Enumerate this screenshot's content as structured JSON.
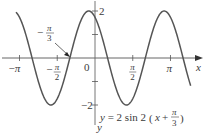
{
  "chart_data": {
    "type": "line",
    "title": "",
    "equation": "y = 2 sin 2(x + π/3)",
    "equation_parts": {
      "prefix": "y = 2 sin 2",
      "open": "(",
      "x": "x + ",
      "frac_num": "π",
      "frac_den": "3",
      "close": ")"
    },
    "xlabel": "x",
    "ylabel": "y",
    "xlim": [
      -3.29,
      4.4
    ],
    "ylim": [
      -2.1,
      2.3
    ],
    "x_ticks": [
      {
        "value": -3.14159,
        "label_sign": "−",
        "label_num": "π",
        "label_den": ""
      },
      {
        "value": -1.5708,
        "label_sign": "−",
        "label_num": "π",
        "label_den": "2"
      },
      {
        "value": 1.5708,
        "label_sign": "",
        "label_num": "π",
        "label_den": "2"
      },
      {
        "value": 3.14159,
        "label_sign": "",
        "label_num": "π",
        "label_den": ""
      }
    ],
    "origin_label": "0",
    "y_ticks": [
      {
        "value": 2,
        "label": "2"
      },
      {
        "value": 1,
        "label": ""
      },
      {
        "value": -1,
        "label": ""
      },
      {
        "value": -2,
        "label": "−2"
      }
    ],
    "annotation": {
      "text_sign": "−",
      "text_num": "π",
      "text_den": "3",
      "x": -1.0472,
      "y": 0
    },
    "series": [
      {
        "name": "y = 2 sin 2(x + π/3)",
        "amplitude": 2,
        "frequency": 2,
        "phase_shift": 1.0472,
        "x_start": -3.29,
        "x_end": 3.98,
        "color": "#555555"
      }
    ],
    "grid": false,
    "legend": "none"
  }
}
